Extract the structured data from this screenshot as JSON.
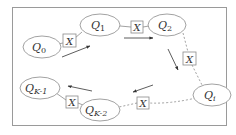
{
  "diagram": {
    "type": "circular queue ring",
    "frame": {
      "stroke": "#9a9a9a"
    },
    "colors": {
      "stroke": "#8a8a8a",
      "text": "#333333",
      "arrow": "#333333"
    },
    "nodes": [
      {
        "id": "q0",
        "label": "Q",
        "subscript": "0"
      },
      {
        "id": "q1",
        "label": "Q",
        "subscript": "1"
      },
      {
        "id": "q2",
        "label": "Q",
        "subscript": "2"
      },
      {
        "id": "qi",
        "label": "Q",
        "subscript": "i"
      },
      {
        "id": "qk2",
        "label": "Q",
        "subscript": "K-2"
      },
      {
        "id": "qk1",
        "label": "Q",
        "subscript": "K-1"
      }
    ],
    "connectors": [
      {
        "id": "x_q0_q1",
        "label": "X",
        "from": "q0",
        "to": "q1",
        "style": "solid"
      },
      {
        "id": "x_q1_q2",
        "label": "X",
        "from": "q1",
        "to": "q2",
        "style": "solid"
      },
      {
        "id": "x_q2_qi",
        "label": "X",
        "from": "q2",
        "to": "qi",
        "style": "dashed"
      },
      {
        "id": "x_qi_qk2",
        "label": "X",
        "from": "qi",
        "to": "qk2",
        "style": "dashed"
      },
      {
        "id": "x_qk2_qk1",
        "label": "X",
        "from": "qk2",
        "to": "qk1",
        "style": "solid"
      }
    ],
    "flow_arrows": [
      "q0->q1 (up-right)",
      "q1->q2 (right)",
      "q2->qi (down-right)",
      "qi->qk2 (down-left)",
      "qk2->qk1 (left)"
    ]
  }
}
